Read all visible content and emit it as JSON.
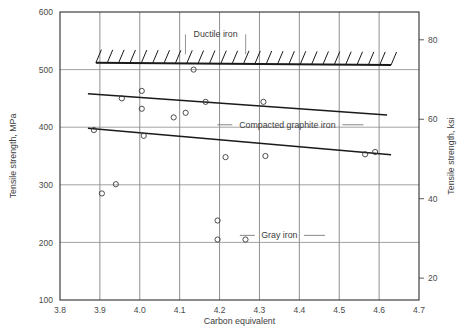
{
  "chart_data": {
    "type": "scatter",
    "title": "",
    "xlabel": "Carbon equivalent",
    "ylabel": "Tensile strength, MPa",
    "y2label": "Tensile strength, ksi",
    "xlim": [
      3.8,
      4.7
    ],
    "ylim": [
      100,
      600
    ],
    "y2lim": [
      14.5,
      87.0
    ],
    "xticks": [
      "3.8",
      "3.9",
      "4.0",
      "4.1",
      "4.2",
      "4.3",
      "4.4",
      "4.5",
      "4.6",
      "4.7"
    ],
    "xtick_values": [
      3.8,
      3.9,
      4.0,
      4.1,
      4.2,
      4.3,
      4.4,
      4.5,
      4.6,
      4.7
    ],
    "yticks": [
      "100",
      "200",
      "300",
      "400",
      "500",
      "600"
    ],
    "ytick_values": [
      100,
      200,
      300,
      400,
      500,
      600
    ],
    "y2ticks": [
      "20",
      "40",
      "60",
      "80"
    ],
    "y2tick_values": [
      20,
      40,
      60,
      80
    ],
    "grid": true,
    "legend_position": "inline-annotations",
    "annotations": [
      {
        "name": "ductile-iron",
        "text": "Ductile iron",
        "x": 4.19,
        "y": 556
      },
      {
        "name": "compacted-graphite-iron",
        "text": "Compacted graphite iron",
        "x": 4.37,
        "y": 399
      },
      {
        "name": "gray-iron",
        "text": "Gray iron",
        "x": 4.35,
        "y": 207
      }
    ],
    "series": [
      {
        "name": "Ductile iron boundary",
        "kind": "hatched-boundary",
        "hatch_direction": "up-right",
        "line": [
          {
            "x": 3.89,
            "y": 512
          },
          {
            "x": 4.63,
            "y": 508
          }
        ]
      },
      {
        "name": "Compacted graphite iron trend",
        "kind": "trend-line",
        "line": [
          {
            "x": 3.87,
            "y": 458
          },
          {
            "x": 4.62,
            "y": 421
          }
        ]
      },
      {
        "name": "Gray iron trend",
        "kind": "trend-line",
        "line": [
          {
            "x": 3.87,
            "y": 398
          },
          {
            "x": 4.63,
            "y": 352
          }
        ]
      },
      {
        "name": "Data points",
        "kind": "scatter",
        "marker": "open-circle",
        "points": [
          {
            "x": 3.885,
            "y": 395
          },
          {
            "x": 3.905,
            "y": 285
          },
          {
            "x": 3.94,
            "y": 301
          },
          {
            "x": 3.955,
            "y": 450
          },
          {
            "x": 4.005,
            "y": 463
          },
          {
            "x": 4.005,
            "y": 432
          },
          {
            "x": 4.01,
            "y": 385
          },
          {
            "x": 4.085,
            "y": 417
          },
          {
            "x": 4.115,
            "y": 425
          },
          {
            "x": 4.135,
            "y": 500
          },
          {
            "x": 4.165,
            "y": 444
          },
          {
            "x": 4.195,
            "y": 238
          },
          {
            "x": 4.195,
            "y": 205
          },
          {
            "x": 4.215,
            "y": 348
          },
          {
            "x": 4.265,
            "y": 205
          },
          {
            "x": 4.31,
            "y": 444
          },
          {
            "x": 4.315,
            "y": 350
          },
          {
            "x": 4.565,
            "y": 353
          },
          {
            "x": 4.59,
            "y": 357
          }
        ]
      }
    ]
  }
}
